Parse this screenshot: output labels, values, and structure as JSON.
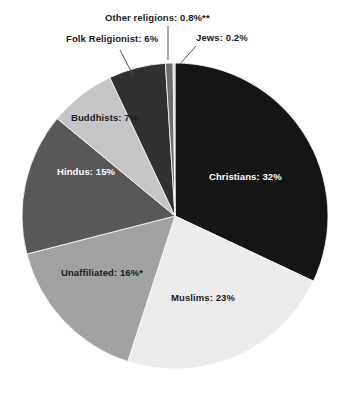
{
  "chart_data": {
    "type": "pie",
    "title": "",
    "subtitle": "",
    "xlabel": "",
    "ylabel": "",
    "legend_position": "none",
    "grid": false,
    "start_angle_deg": 0,
    "direction": "clockwise",
    "categories": [
      "Christians",
      "Muslims",
      "Unaffiliated",
      "Hindus",
      "Buddhists",
      "Folk Religionist",
      "Other religions",
      "Jews"
    ],
    "values": [
      32,
      23,
      16,
      15,
      7,
      6,
      0.8,
      0.2
    ],
    "slices": [
      {
        "name": "Christians",
        "label": "Christians: 32%",
        "value": 32,
        "value_text": "32%",
        "color": "#151515",
        "text_color": "#ffffff",
        "label_placement": "inside"
      },
      {
        "name": "Muslims",
        "label": "Muslims: 23%",
        "value": 23,
        "value_text": "23%",
        "color": "#ececec",
        "text_color": "#1b1b1b",
        "label_placement": "inside"
      },
      {
        "name": "Unaffiliated",
        "label": "Unaffiliated: 16%*",
        "value": 16,
        "value_text": "16%*",
        "color": "#a2a2a2",
        "text_color": "#1b1b1b",
        "label_placement": "inside"
      },
      {
        "name": "Hindus",
        "label": "Hindus: 15%",
        "value": 15,
        "value_text": "15%",
        "color": "#585858",
        "text_color": "#ffffff",
        "label_placement": "inside"
      },
      {
        "name": "Buddhists",
        "label": "Buddhists: 7%",
        "value": 7,
        "value_text": "7%",
        "color": "#c6c6c6",
        "text_color": "#1b1b1b",
        "label_placement": "inside"
      },
      {
        "name": "Folk Religionist",
        "label": "Folk Religionist: 6%",
        "value": 6,
        "value_text": "6%",
        "color": "#303030",
        "text_color": "#1b1b1b",
        "label_placement": "outside-leader"
      },
      {
        "name": "Other religions",
        "label": "Other religions: 0.8%**",
        "value": 0.8,
        "value_text": "0.8%**",
        "color": "#6e6e6e",
        "text_color": "#1b1b1b",
        "label_placement": "outside-leader"
      },
      {
        "name": "Jews",
        "label": "Jews: 0.2%",
        "value": 0.2,
        "value_text": "0.2%",
        "color": "#cfcfcf",
        "text_color": "#1b1b1b",
        "label_placement": "outside-leader"
      }
    ],
    "footnote_markers": [
      "*",
      "**"
    ],
    "geometry": {
      "center_x": 175,
      "center_y": 216,
      "radius": 153
    }
  }
}
